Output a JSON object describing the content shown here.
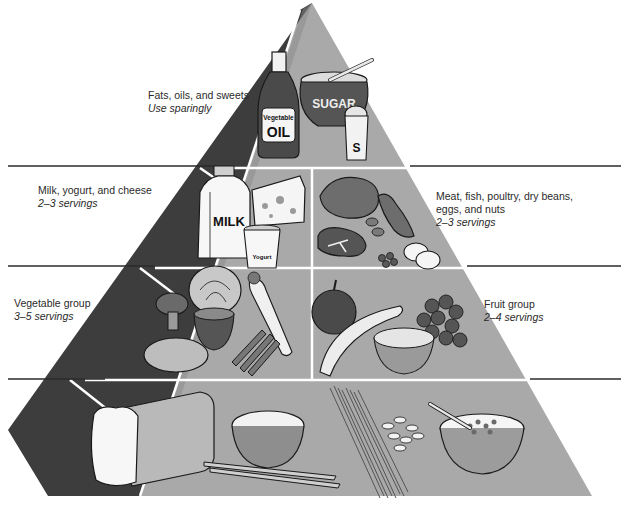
{
  "diagram": {
    "type": "food-guide-pyramid",
    "colors": {
      "face_light": "#a9a9a9",
      "face_dark": "#3a3a3a",
      "divider": "#2b2b2b",
      "background": "#ffffff",
      "outline": "#1a1a1a"
    },
    "tiers": [
      {
        "id": "fats",
        "title": "Fats, oils, and sweets",
        "subtitle": "Use sparingly",
        "side": "left",
        "items": [
          {
            "name": "vegetable-oil-bottle",
            "text_1": "Vegetable",
            "text_2": "OIL"
          },
          {
            "name": "sugar-bowl",
            "text_1": "SUGAR"
          },
          {
            "name": "salt-shaker",
            "text_1": "S"
          }
        ]
      },
      {
        "id": "dairy",
        "title": "Milk, yogurt, and cheese",
        "subtitle": "2–3 servings",
        "side": "left",
        "items": [
          {
            "name": "milk-jug",
            "text_1": "MILK"
          },
          {
            "name": "cheese-wedge"
          },
          {
            "name": "yogurt-cup",
            "text_1": "Yogurt"
          }
        ]
      },
      {
        "id": "protein",
        "title_line_1": "Meat, fish, poultry, dry beans,",
        "title_line_2": "eggs, and nuts",
        "subtitle": "2–3 servings",
        "side": "right",
        "items": [
          {
            "name": "roast-chicken"
          },
          {
            "name": "fish"
          },
          {
            "name": "t-bone-steak"
          },
          {
            "name": "nuts"
          },
          {
            "name": "beans"
          },
          {
            "name": "eggs"
          }
        ]
      },
      {
        "id": "vegetables",
        "title": "Vegetable group",
        "subtitle": "3–5 servings",
        "side": "left",
        "items": [
          {
            "name": "cabbage"
          },
          {
            "name": "broccoli"
          },
          {
            "name": "tomato-half"
          },
          {
            "name": "carrot"
          },
          {
            "name": "potato"
          },
          {
            "name": "green-beans"
          }
        ]
      },
      {
        "id": "fruits",
        "title": "Fruit group",
        "subtitle": "2–4 servings",
        "side": "right",
        "items": [
          {
            "name": "apple"
          },
          {
            "name": "banana"
          },
          {
            "name": "grapes"
          },
          {
            "name": "orange-half"
          }
        ]
      },
      {
        "id": "grains",
        "items": [
          {
            "name": "bread-loaf"
          },
          {
            "name": "rice-bowl"
          },
          {
            "name": "breadsticks"
          },
          {
            "name": "spaghetti"
          },
          {
            "name": "macaroni"
          },
          {
            "name": "cereal-bowl"
          }
        ]
      }
    ]
  }
}
